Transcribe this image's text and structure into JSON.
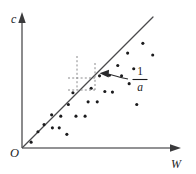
{
  "figure": {
    "caption_visible": false,
    "background_color": "#ffffff",
    "axis_color": "#6e6e70",
    "line_color": "#4a4a4c",
    "point_color": "#1b1b1d",
    "dash_color": "#8a8a8c",
    "callout_color": "#2a2a2c"
  },
  "labels": {
    "y_axis": "c",
    "x_axis": "W",
    "origin": "O",
    "slope_numerator": "1",
    "slope_denominator": "a"
  },
  "chart_data": {
    "type": "scatter",
    "title": "",
    "xlabel": "W",
    "ylabel": "c",
    "grid": false,
    "legend": null,
    "xlim": [
      0,
      10
    ],
    "ylim": [
      0,
      10
    ],
    "axis_ticks": {
      "x": [],
      "y": []
    },
    "origin_label": "O",
    "points": [
      {
        "x": 0.6,
        "y": 0.45
      },
      {
        "x": 1.05,
        "y": 1.25
      },
      {
        "x": 1.45,
        "y": 1.8
      },
      {
        "x": 2.0,
        "y": 1.55
      },
      {
        "x": 2.45,
        "y": 1.55
      },
      {
        "x": 1.95,
        "y": 2.55
      },
      {
        "x": 2.55,
        "y": 2.45
      },
      {
        "x": 3.05,
        "y": 3.35
      },
      {
        "x": 3.55,
        "y": 2.45
      },
      {
        "x": 4.15,
        "y": 2.45
      },
      {
        "x": 3.35,
        "y": 4.25
      },
      {
        "x": 4.35,
        "y": 3.55
      },
      {
        "x": 4.95,
        "y": 3.55
      },
      {
        "x": 4.55,
        "y": 4.6
      },
      {
        "x": 5.45,
        "y": 4.35
      },
      {
        "x": 5.95,
        "y": 4.3
      },
      {
        "x": 5.1,
        "y": 5.55
      },
      {
        "x": 5.75,
        "y": 5.6
      },
      {
        "x": 6.55,
        "y": 5.55
      },
      {
        "x": 6.3,
        "y": 6.35
      },
      {
        "x": 7.05,
        "y": 4.95
      },
      {
        "x": 7.35,
        "y": 6.1
      },
      {
        "x": 6.95,
        "y": 7.3
      },
      {
        "x": 7.95,
        "y": 8.05
      },
      {
        "x": 8.6,
        "y": 7.15
      },
      {
        "x": 7.55,
        "y": 3.35
      },
      {
        "x": 2.95,
        "y": 1.05
      }
    ],
    "fit_line": {
      "type": "line",
      "through_origin": true,
      "x": [
        0,
        8.6
      ],
      "y": [
        0,
        9.0
      ],
      "slope_label": "1/a",
      "slope_label_meaning": "inverse of a is the slope of the fitted line"
    },
    "annotations": [
      {
        "kind": "slope-triangle",
        "style": "dashed",
        "label": "1/a",
        "arrow": "points left from label to the dashed slope triangle"
      }
    ]
  }
}
